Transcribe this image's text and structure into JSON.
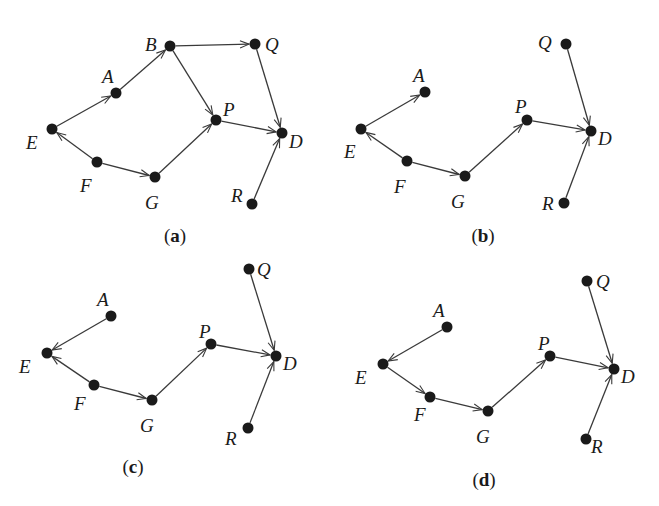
{
  "figure": {
    "panels": [
      {
        "id": "a",
        "caption": "a",
        "caption_pos": [
          175,
          242
        ],
        "nodes": [
          {
            "id": "A",
            "x": 116,
            "y": 93,
            "label_dx": -14,
            "label_dy": -10
          },
          {
            "id": "B",
            "x": 170,
            "y": 46,
            "label_dx": -25,
            "label_dy": 5
          },
          {
            "id": "Q",
            "x": 255,
            "y": 44,
            "label_dx": 10,
            "label_dy": 7
          },
          {
            "id": "E",
            "x": 52,
            "y": 129,
            "label_dx": -26,
            "label_dy": 20
          },
          {
            "id": "P",
            "x": 216,
            "y": 120,
            "label_dx": 7,
            "label_dy": -4
          },
          {
            "id": "D",
            "x": 282,
            "y": 133,
            "label_dx": 7,
            "label_dy": 15
          },
          {
            "id": "F",
            "x": 97,
            "y": 162,
            "label_dx": -17,
            "label_dy": 30
          },
          {
            "id": "G",
            "x": 155,
            "y": 177,
            "label_dx": -10,
            "label_dy": 32
          },
          {
            "id": "R",
            "x": 252,
            "y": 204,
            "label_dx": -21,
            "label_dy": -2
          }
        ],
        "edges": [
          {
            "from": "E",
            "to": "A"
          },
          {
            "from": "A",
            "to": "B"
          },
          {
            "from": "B",
            "to": "Q"
          },
          {
            "from": "B",
            "to": "P"
          },
          {
            "from": "Q",
            "to": "D"
          },
          {
            "from": "P",
            "to": "D"
          },
          {
            "from": "F",
            "to": "E"
          },
          {
            "from": "F",
            "to": "G"
          },
          {
            "from": "G",
            "to": "P"
          },
          {
            "from": "R",
            "to": "D"
          }
        ]
      },
      {
        "id": "b",
        "caption": "b",
        "caption_pos": [
          483,
          242
        ],
        "nodes": [
          {
            "id": "A",
            "x": 425,
            "y": 92,
            "label_dx": -12,
            "label_dy": -10
          },
          {
            "id": "Q",
            "x": 566,
            "y": 44,
            "label_dx": -28,
            "label_dy": 5
          },
          {
            "id": "E",
            "x": 361,
            "y": 129,
            "label_dx": -17,
            "label_dy": 29
          },
          {
            "id": "P",
            "x": 527,
            "y": 120,
            "label_dx": -12,
            "label_dy": -7
          },
          {
            "id": "D",
            "x": 591,
            "y": 131,
            "label_dx": 7,
            "label_dy": 14
          },
          {
            "id": "F",
            "x": 407,
            "y": 161,
            "label_dx": -13,
            "label_dy": 32
          },
          {
            "id": "G",
            "x": 465,
            "y": 176,
            "label_dx": -14,
            "label_dy": 32
          },
          {
            "id": "R",
            "x": 564,
            "y": 203,
            "label_dx": -22,
            "label_dy": 7
          }
        ],
        "edges": [
          {
            "from": "E",
            "to": "A"
          },
          {
            "from": "F",
            "to": "E"
          },
          {
            "from": "F",
            "to": "G"
          },
          {
            "from": "G",
            "to": "P"
          },
          {
            "from": "P",
            "to": "D"
          },
          {
            "from": "Q",
            "to": "D"
          },
          {
            "from": "R",
            "to": "D"
          }
        ]
      },
      {
        "id": "c",
        "caption": "c",
        "caption_pos": [
          133,
          473
        ],
        "nodes": [
          {
            "id": "A",
            "x": 111,
            "y": 316,
            "label_dx": -14,
            "label_dy": -10
          },
          {
            "id": "Q",
            "x": 249,
            "y": 269,
            "label_dx": 8,
            "label_dy": 7
          },
          {
            "id": "E",
            "x": 47,
            "y": 353,
            "label_dx": -28,
            "label_dy": 20
          },
          {
            "id": "P",
            "x": 211,
            "y": 344,
            "label_dx": -12,
            "label_dy": -6
          },
          {
            "id": "D",
            "x": 276,
            "y": 356,
            "label_dx": 7,
            "label_dy": 14
          },
          {
            "id": "F",
            "x": 94,
            "y": 385,
            "label_dx": -20,
            "label_dy": 25
          },
          {
            "id": "G",
            "x": 152,
            "y": 400,
            "label_dx": -12,
            "label_dy": 32
          },
          {
            "id": "R",
            "x": 248,
            "y": 428,
            "label_dx": -23,
            "label_dy": 17
          }
        ],
        "edges": [
          {
            "from": "A",
            "to": "E"
          },
          {
            "from": "F",
            "to": "E"
          },
          {
            "from": "F",
            "to": "G"
          },
          {
            "from": "G",
            "to": "P"
          },
          {
            "from": "P",
            "to": "D"
          },
          {
            "from": "Q",
            "to": "D"
          },
          {
            "from": "R",
            "to": "D"
          }
        ]
      },
      {
        "id": "d",
        "caption": "d",
        "caption_pos": [
          484,
          486
        ],
        "nodes": [
          {
            "id": "A",
            "x": 447,
            "y": 327,
            "label_dx": -14,
            "label_dy": -10
          },
          {
            "id": "Q",
            "x": 587,
            "y": 281,
            "label_dx": 9,
            "label_dy": 7
          },
          {
            "id": "E",
            "x": 383,
            "y": 364,
            "label_dx": -28,
            "label_dy": 20
          },
          {
            "id": "P",
            "x": 550,
            "y": 356,
            "label_dx": -12,
            "label_dy": -6
          },
          {
            "id": "D",
            "x": 614,
            "y": 369,
            "label_dx": 7,
            "label_dy": 14
          },
          {
            "id": "F",
            "x": 430,
            "y": 397,
            "label_dx": -16,
            "label_dy": 24
          },
          {
            "id": "G",
            "x": 488,
            "y": 411,
            "label_dx": -12,
            "label_dy": 32
          },
          {
            "id": "R",
            "x": 586,
            "y": 439,
            "label_dx": 5,
            "label_dy": 14
          }
        ],
        "edges": [
          {
            "from": "A",
            "to": "E"
          },
          {
            "from": "E",
            "to": "F"
          },
          {
            "from": "F",
            "to": "G"
          },
          {
            "from": "G",
            "to": "P"
          },
          {
            "from": "P",
            "to": "D"
          },
          {
            "from": "Q",
            "to": "D"
          },
          {
            "from": "R",
            "to": "D"
          }
        ]
      }
    ],
    "style": {
      "node_radius": 5.5,
      "node_color": "#1a1a1a",
      "edge_color": "#3a3a3a"
    }
  }
}
